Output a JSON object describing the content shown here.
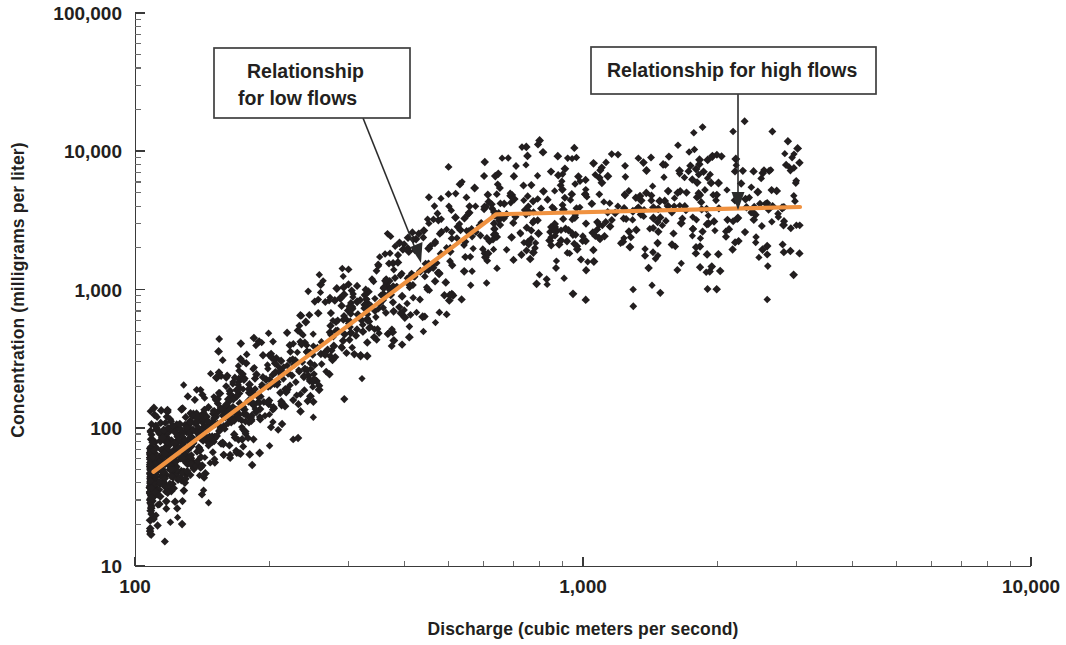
{
  "chart_data": {
    "type": "scatter",
    "title": "",
    "xlabel": "Discharge (cubic meters per second)",
    "ylabel": "Concentration (milligrams per liter)",
    "xscale": "log",
    "yscale": "log",
    "xlim": [
      100,
      10000
    ],
    "ylim": [
      10,
      100000
    ],
    "grid": false,
    "legend": null,
    "x_tick_labels": [
      "100",
      "1,000",
      "10,000"
    ],
    "x_tick_values": [
      100,
      1000,
      10000
    ],
    "y_tick_labels": [
      "10",
      "100",
      "1,000",
      "10,000",
      "100,000"
    ],
    "y_tick_values": [
      10,
      100,
      1000,
      10000,
      100000
    ],
    "point_color": "#221e1f",
    "point_marker": "diamond",
    "point_count": 1450,
    "series": [
      {
        "name": "Observed samples",
        "description": "Suspended sediment concentration versus discharge; ~1450 dark diamond markers forming a broad cloud rising from roughly (110, 60) to a plateau near 3,000-4,000 mg/L above 700 m3/s",
        "x_range": [
          108,
          3100
        ],
        "y_range": [
          12,
          19000
        ]
      }
    ],
    "annotations": [
      {
        "id": "low-flow-callout",
        "text_lines": [
          "Relationship",
          "for low flows"
        ],
        "box": {
          "x": 214,
          "y": 48,
          "width": 196,
          "height": 70
        },
        "leader_from": {
          "x": 363,
          "y": 118
        },
        "leader_to": {
          "x": 421,
          "y": 262
        }
      },
      {
        "id": "high-flow-callout",
        "text_lines": [
          "Relationship for high flows"
        ],
        "box": {
          "x": 591,
          "y": 47,
          "width": 285,
          "height": 47
        },
        "leader_from": {
          "x": 738,
          "y": 94
        },
        "leader_to": {
          "x": 738,
          "y": 208
        }
      }
    ],
    "trend_line": {
      "color": "#f09240",
      "style": "piecewise-linear two segment",
      "breakpoint": {
        "x": 640,
        "y": 3500
      },
      "segments": [
        {
          "name": "low-flow segment",
          "from": {
            "x": 110,
            "y": 48
          },
          "to": {
            "x": 640,
            "y": 3500
          }
        },
        {
          "name": "high-flow segment",
          "from": {
            "x": 640,
            "y": 3500
          },
          "to": {
            "x": 3050,
            "y": 3950
          }
        }
      ]
    }
  },
  "axes": {
    "x_title": "Discharge (cubic meters per second)",
    "y_title": "Concentration (milligrams per liter)",
    "x_labels": [
      "100",
      "1,000",
      "10,000"
    ],
    "y_labels": [
      "100,000",
      "10,000",
      "1,000",
      "100",
      "10"
    ]
  },
  "callouts": {
    "low": {
      "line1": "Relationship",
      "line2": "for low flows"
    },
    "high": {
      "line1": "Relationship for high flows"
    }
  }
}
